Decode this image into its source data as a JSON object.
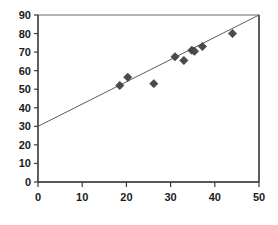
{
  "chart_data": {
    "type": "scatter",
    "title": "",
    "subtitle": "",
    "xlabel": "",
    "ylabel": "",
    "xlim": [
      0,
      50
    ],
    "ylim": [
      0,
      90
    ],
    "xticks": [
      0,
      10,
      20,
      30,
      40,
      50
    ],
    "yticks": [
      0,
      10,
      20,
      30,
      40,
      50,
      60,
      70,
      80,
      90
    ],
    "xtick_labels": [
      "0",
      "10",
      "20",
      "30",
      "40",
      "50"
    ],
    "ytick_labels": [
      "0",
      "10",
      "20",
      "30",
      "40",
      "50",
      "60",
      "70",
      "80",
      "90"
    ],
    "grid": false,
    "legend": null,
    "legend_position": "none",
    "series": [
      {
        "name": "observations",
        "type": "scatter",
        "marker": "diamond",
        "marker_color": "#4a4a4a",
        "points": [
          {
            "x": 18.5,
            "y": 52.0
          },
          {
            "x": 20.3,
            "y": 56.5
          },
          {
            "x": 26.2,
            "y": 53.0
          },
          {
            "x": 31.0,
            "y": 67.5
          },
          {
            "x": 33.0,
            "y": 65.5
          },
          {
            "x": 34.8,
            "y": 71.0
          },
          {
            "x": 35.4,
            "y": 70.5
          },
          {
            "x": 37.2,
            "y": 73.0
          },
          {
            "x": 44.0,
            "y": 80.0
          }
        ]
      },
      {
        "name": "trend-line",
        "type": "line",
        "line_color": "#5c5c5c",
        "points": [
          {
            "x": 0,
            "y": 30
          },
          {
            "x": 50,
            "y": 90
          }
        ]
      }
    ],
    "colors": {
      "marker": "#4a4a4a",
      "trend_line": "#5c5c5c",
      "axis": "#3a3a3a",
      "plot_border": "#6b6b6b",
      "background": "#ffffff",
      "tick_text": "#1a1a1a"
    },
    "geometry": {
      "plot_left_px": 38,
      "plot_right_px": 259,
      "plot_top_px": 15,
      "plot_bottom_px": 182
    }
  }
}
